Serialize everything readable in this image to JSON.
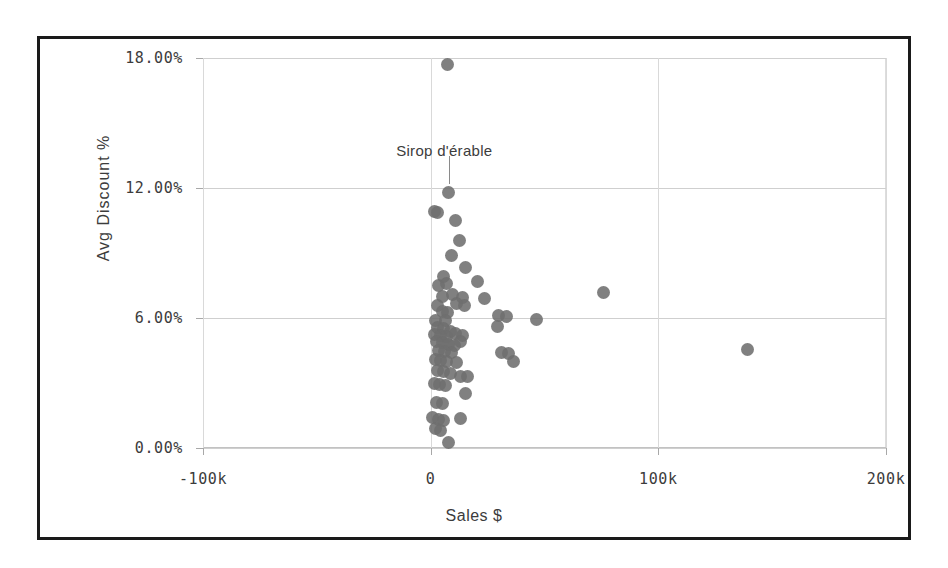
{
  "figure": {
    "frame_border_color": "#1a1a1a",
    "background": "#ffffff",
    "point_color": "#6e6e6e",
    "gridline_color": "#cfcfcf"
  },
  "axes": {
    "y_title": "Avg Discount %",
    "x_title": "Sales $",
    "y_ticks": [
      "18.00%",
      "12.00%",
      "6.00%",
      "0.00%"
    ],
    "x_ticks": [
      "-100k",
      "0",
      "100k",
      "200k"
    ]
  },
  "annotation": {
    "label": "Sirop d'érable"
  },
  "chart_data": {
    "type": "scatter",
    "title": "",
    "xlabel": "Sales $",
    "ylabel": "Avg Discount %",
    "xlim": [
      -100000,
      200000
    ],
    "ylim": [
      0,
      18
    ],
    "xtick_values": [
      -100000,
      0,
      100000,
      200000
    ],
    "xtick_labels": [
      "-100k",
      "0",
      "100k",
      "200k"
    ],
    "ytick_values": [
      0,
      6,
      12,
      18
    ],
    "ytick_labels": [
      "0.00%",
      "6.00%",
      "12.00%",
      "18.00%"
    ],
    "grid": true,
    "legend": "none",
    "annotations": [
      {
        "text": "Sirop d'érable",
        "x": 8000,
        "y": 11.8,
        "label_x": 6000,
        "label_y": 13.7
      }
    ],
    "series": [
      {
        "name": "Products",
        "marker": "circle",
        "color": "#6e6e6e",
        "points": [
          {
            "x": 7500,
            "y": 17.7
          },
          {
            "x": 8000,
            "y": 11.8
          },
          {
            "x": 1500,
            "y": 10.9
          },
          {
            "x": 3000,
            "y": 10.85
          },
          {
            "x": 11000,
            "y": 10.5
          },
          {
            "x": 12500,
            "y": 9.6
          },
          {
            "x": 9000,
            "y": 8.9
          },
          {
            "x": 15500,
            "y": 8.35
          },
          {
            "x": 5500,
            "y": 7.9
          },
          {
            "x": 3500,
            "y": 7.5
          },
          {
            "x": 7000,
            "y": 7.6
          },
          {
            "x": 20500,
            "y": 7.7
          },
          {
            "x": 5000,
            "y": 7.0
          },
          {
            "x": 9500,
            "y": 7.1
          },
          {
            "x": 14000,
            "y": 6.95
          },
          {
            "x": 3000,
            "y": 6.6
          },
          {
            "x": 11500,
            "y": 6.65
          },
          {
            "x": 15000,
            "y": 6.6
          },
          {
            "x": 23500,
            "y": 6.9
          },
          {
            "x": 76000,
            "y": 7.2
          },
          {
            "x": 5000,
            "y": 6.3
          },
          {
            "x": 7500,
            "y": 6.25
          },
          {
            "x": 2000,
            "y": 5.9
          },
          {
            "x": 6500,
            "y": 5.9
          },
          {
            "x": 30000,
            "y": 6.1
          },
          {
            "x": 33500,
            "y": 6.05
          },
          {
            "x": 46500,
            "y": 5.95
          },
          {
            "x": 3000,
            "y": 5.55
          },
          {
            "x": 5500,
            "y": 5.5
          },
          {
            "x": 8500,
            "y": 5.4
          },
          {
            "x": 1500,
            "y": 5.25
          },
          {
            "x": 4500,
            "y": 5.2
          },
          {
            "x": 7000,
            "y": 5.15
          },
          {
            "x": 11000,
            "y": 5.3
          },
          {
            "x": 14000,
            "y": 5.2
          },
          {
            "x": 29500,
            "y": 5.6
          },
          {
            "x": 2500,
            "y": 4.9
          },
          {
            "x": 5000,
            "y": 4.85
          },
          {
            "x": 8000,
            "y": 4.8
          },
          {
            "x": 10500,
            "y": 4.75
          },
          {
            "x": 13000,
            "y": 4.9
          },
          {
            "x": 3500,
            "y": 4.5
          },
          {
            "x": 6000,
            "y": 4.45
          },
          {
            "x": 9000,
            "y": 4.4
          },
          {
            "x": 31000,
            "y": 4.4
          },
          {
            "x": 34000,
            "y": 4.35
          },
          {
            "x": 36500,
            "y": 4.0
          },
          {
            "x": 139000,
            "y": 4.55
          },
          {
            "x": 2000,
            "y": 4.1
          },
          {
            "x": 4500,
            "y": 4.05
          },
          {
            "x": 7000,
            "y": 4.0
          },
          {
            "x": 11500,
            "y": 3.95
          },
          {
            "x": 3000,
            "y": 3.6
          },
          {
            "x": 5500,
            "y": 3.55
          },
          {
            "x": 8500,
            "y": 3.45
          },
          {
            "x": 13000,
            "y": 3.3
          },
          {
            "x": 16000,
            "y": 3.3
          },
          {
            "x": 1500,
            "y": 3.0
          },
          {
            "x": 4000,
            "y": 2.95
          },
          {
            "x": 6500,
            "y": 2.9
          },
          {
            "x": 15500,
            "y": 2.5
          },
          {
            "x": 2500,
            "y": 2.1
          },
          {
            "x": 5000,
            "y": 2.05
          },
          {
            "x": 1000,
            "y": 1.4
          },
          {
            "x": 3500,
            "y": 1.3
          },
          {
            "x": 5500,
            "y": 1.25
          },
          {
            "x": 13000,
            "y": 1.35
          },
          {
            "x": 2000,
            "y": 0.9
          },
          {
            "x": 4500,
            "y": 0.8
          },
          {
            "x": 8000,
            "y": 0.25
          }
        ]
      }
    ]
  }
}
